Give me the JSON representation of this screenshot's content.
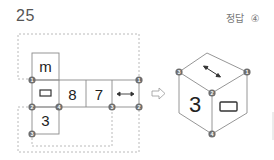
{
  "question": {
    "number": "25"
  },
  "answer": {
    "label": "정답",
    "value": "④"
  },
  "net": {
    "cells": [
      {
        "id": "m",
        "content": "m",
        "type": "text"
      },
      {
        "id": "rect",
        "content": "▭",
        "type": "rectangle-symbol"
      },
      {
        "id": "8",
        "content": "8",
        "type": "text"
      },
      {
        "id": "7",
        "content": "7",
        "type": "text"
      },
      {
        "id": "arrow",
        "content": "↔",
        "type": "double-arrow"
      },
      {
        "id": "3",
        "content": "3",
        "type": "text"
      }
    ],
    "vertex_markers": [
      "1",
      "1",
      "2",
      "4",
      "3",
      "2",
      "3"
    ]
  },
  "transform_arrow": "⇨",
  "cube": {
    "faces": {
      "top": "↔",
      "front_left": "3",
      "front_right": "▭"
    },
    "vertex_markers": [
      "3",
      "1",
      "2",
      "4"
    ]
  },
  "colors": {
    "line": "#8a8a8a",
    "dash": "#a0a0a0",
    "marker": "#6e6e6e",
    "marker_text": "#ffffff"
  }
}
